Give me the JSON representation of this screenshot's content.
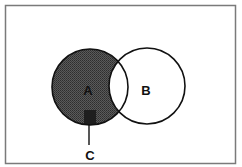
{
  "diagram": {
    "type": "venn",
    "frame": {
      "x": 5,
      "y": 5,
      "width": 231,
      "height": 159,
      "stroke": "#7a7a7a"
    },
    "sets": [
      {
        "id": "A",
        "label": "A",
        "cx": 90,
        "cy": 87,
        "r": 38,
        "shaded": true,
        "fill": "#4a4a4a"
      },
      {
        "id": "B",
        "label": "B",
        "cx": 147,
        "cy": 86,
        "r": 38,
        "shaded": false
      }
    ],
    "regions": {
      "A_only": "shaded",
      "A_and_B": "unshaded",
      "B_only": "unshaded"
    },
    "callout": {
      "label": "C",
      "marker": {
        "x": 84,
        "y": 110,
        "width": 12,
        "height": 15,
        "fill": "#1e1e1e"
      },
      "line": {
        "x": 89,
        "y1": 125,
        "y2": 145
      }
    }
  }
}
